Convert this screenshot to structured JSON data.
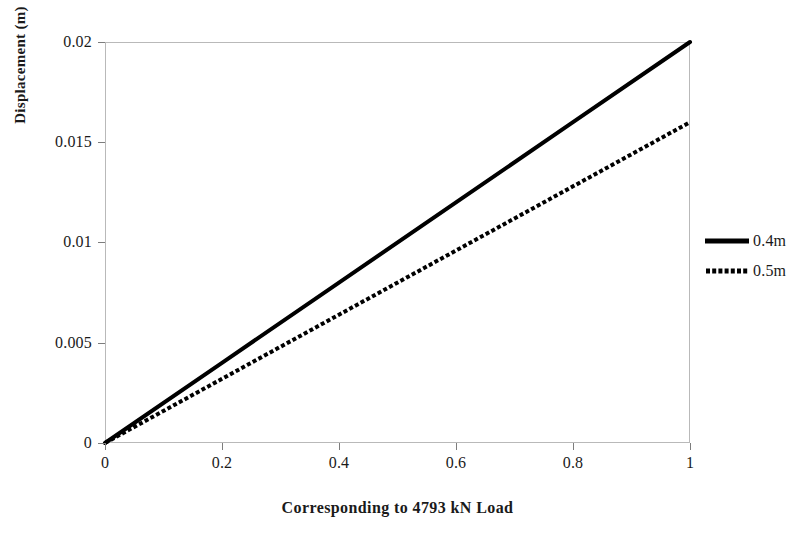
{
  "chart_data": {
    "type": "line",
    "title": "",
    "xlabel": "Corresponding to 4793 kN Load",
    "ylabel": "Displacement (m)",
    "xlim": [
      0,
      1
    ],
    "ylim": [
      0,
      0.02
    ],
    "grid": false,
    "legend_position": "right",
    "x_ticks": [
      "0",
      "0.2",
      "0.4",
      "0.6",
      "0.8",
      "1"
    ],
    "x_tick_values": [
      0,
      0.2,
      0.4,
      0.6,
      0.8,
      1
    ],
    "y_ticks": [
      "0",
      "0.005",
      "0.01",
      "0.015",
      "0.02"
    ],
    "y_tick_values": [
      0,
      0.005,
      0.01,
      0.015,
      0.02
    ],
    "x": [
      0,
      0.2,
      0.4,
      0.6,
      0.8,
      1
    ],
    "series": [
      {
        "name": "0.4m",
        "style": "solid",
        "color": "#000000",
        "width": 4,
        "values": [
          0,
          0.004,
          0.008,
          0.012,
          0.016,
          0.02
        ]
      },
      {
        "name": "0.5m",
        "style": "dotted",
        "color": "#000000",
        "width": 4,
        "values": [
          0,
          0.0032,
          0.0064,
          0.0096,
          0.0128,
          0.016
        ]
      }
    ]
  },
  "axes": {
    "y_title": "Displacement (m)",
    "x_title": "Corresponding to 4793 kN Load",
    "y_tick_labels": [
      "0.02",
      "0.015",
      "0.01",
      "0.005",
      "0"
    ],
    "x_tick_labels": [
      "0",
      "0.2",
      "0.4",
      "0.6",
      "0.8",
      "1"
    ],
    "frame_color": "#b9b9b9",
    "tick_color": "#7d7d7d"
  },
  "legend": {
    "entries": [
      {
        "label": "0.4m",
        "style": "solid"
      },
      {
        "label": "0.5m",
        "style": "dotted"
      }
    ]
  }
}
